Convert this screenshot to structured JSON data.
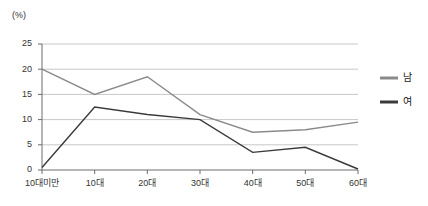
{
  "chart_data": {
    "type": "line",
    "title": "",
    "xlabel": "",
    "ylabel": "",
    "unit_label": "(%)",
    "categories": [
      "10대미만",
      "10대",
      "20대",
      "30대",
      "40대",
      "50대",
      "60대"
    ],
    "yticks": [
      0,
      5,
      10,
      15,
      20,
      25
    ],
    "ylim": [
      0,
      25
    ],
    "grid": true,
    "legend_position": "right",
    "series": [
      {
        "name": "남",
        "color": "#8a8a8a",
        "values": [
          20.0,
          15.0,
          18.5,
          11.0,
          7.5,
          8.0,
          9.5
        ]
      },
      {
        "name": "여",
        "color": "#3a3a3a",
        "values": [
          0.5,
          12.5,
          11.0,
          10.0,
          3.5,
          4.5,
          0.2
        ]
      }
    ]
  },
  "legend": {
    "items": [
      {
        "label": "남"
      },
      {
        "label": "여"
      }
    ]
  },
  "colors": {
    "male_line": "#8a8a8a",
    "female_line": "#3a3a3a",
    "gridline": "#b9b9b9",
    "axis": "#6d6d6d",
    "text": "#333333",
    "background": "#ffffff"
  }
}
